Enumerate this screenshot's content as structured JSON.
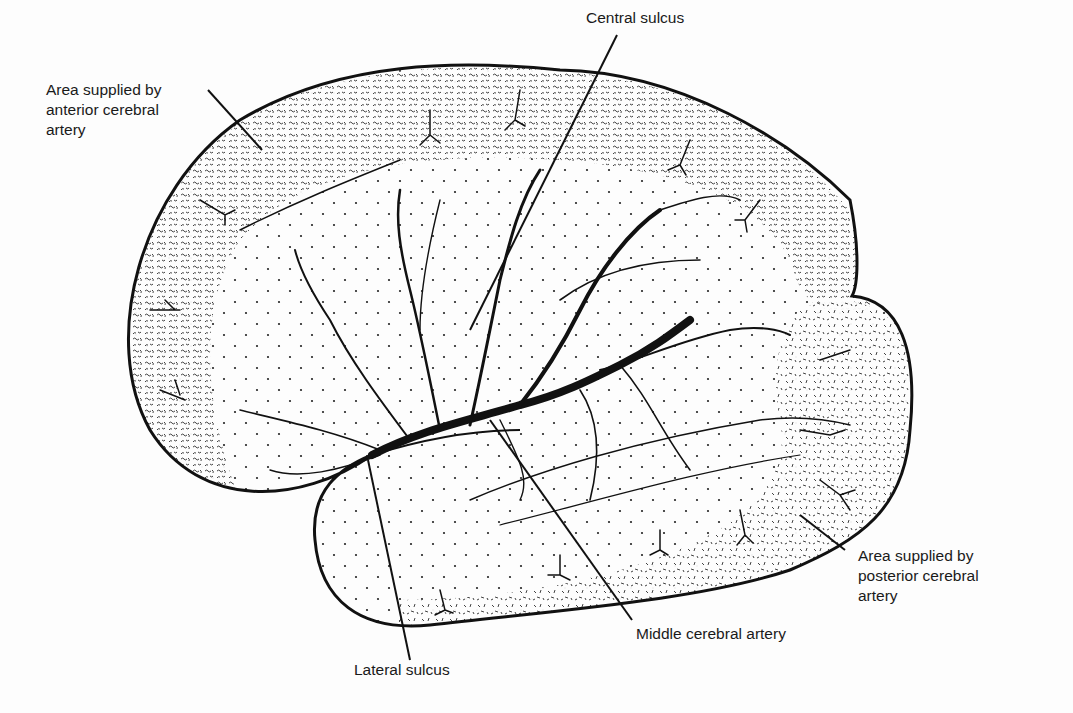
{
  "figure": {
    "labels": {
      "anterior": "Area supplied by\nanterior cerebral\nartery",
      "central_sulcus": "Central sulcus",
      "posterior": "Area supplied by\nposterior cerebral\nartery",
      "middle_cerebral": "Middle cerebral artery",
      "lateral_sulcus": "Lateral sulcus"
    },
    "regions": [
      {
        "name": "anterior cerebral artery territory",
        "pattern": "dense squiggle stipple",
        "location": "superior/anterior rim"
      },
      {
        "name": "middle cerebral artery territory",
        "pattern": "sparse dots",
        "location": "central lateral surface"
      },
      {
        "name": "posterior cerebral artery territory",
        "pattern": "short dashes",
        "location": "posterior/inferior rim"
      }
    ],
    "colors": {
      "ink": "#111111",
      "background": "#fdfdfd"
    }
  }
}
